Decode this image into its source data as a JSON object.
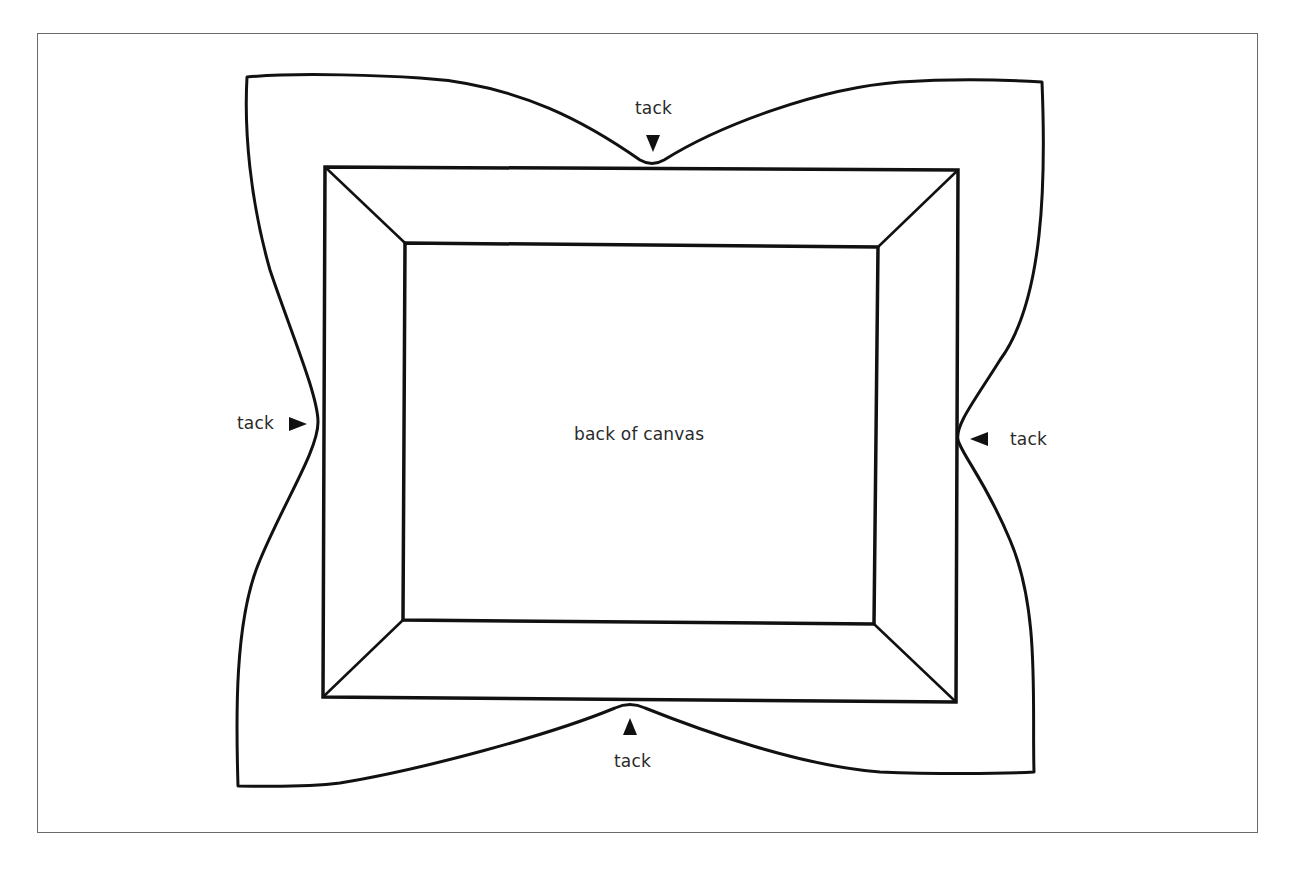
{
  "figure": {
    "center_label": "back of canvas",
    "tacks": [
      {
        "position": "top",
        "label": "tack",
        "arrow": "down"
      },
      {
        "position": "left",
        "label": "tack",
        "arrow": "right"
      },
      {
        "position": "right",
        "label": "tack",
        "arrow": "left"
      },
      {
        "position": "bottom",
        "label": "tack",
        "arrow": "up"
      }
    ]
  },
  "colors": {
    "line": "#111111",
    "frame_border": "#6a6a6a",
    "text": "#2a2a2a",
    "background": "#ffffff"
  }
}
